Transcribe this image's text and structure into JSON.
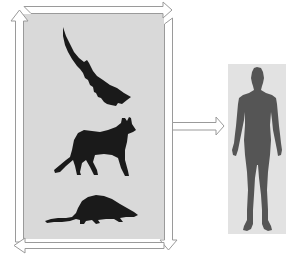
{
  "diagram": {
    "description": "Animal models (bat, fox, shrew) in a cycle leading to human",
    "colors": {
      "animal_panel_bg": "#d9d9d9",
      "human_panel_bg": "#e2e2e2",
      "animal_silhouette": "#1a1a1a",
      "human_silhouette": "#555555",
      "arrow_stroke": "#9a9a9a",
      "arrow_fill": "#ffffff"
    },
    "nodes": [
      {
        "id": "bat",
        "label": "bat-silhouette",
        "icon": "bat-icon"
      },
      {
        "id": "fox",
        "label": "fox-silhouette",
        "icon": "fox-icon"
      },
      {
        "id": "shrew",
        "label": "shrew-silhouette",
        "icon": "shrew-icon"
      },
      {
        "id": "human",
        "label": "human-silhouette",
        "icon": "human-icon"
      }
    ],
    "edges": [
      {
        "from": "left-side",
        "to": "top",
        "style": "outline-arrow-up"
      },
      {
        "from": "top",
        "to": "right-side",
        "style": "outline-arrow-right"
      },
      {
        "from": "right-side",
        "to": "bottom",
        "style": "outline-arrow-down"
      },
      {
        "from": "bottom",
        "to": "left-side",
        "style": "outline-arrow-left"
      },
      {
        "from": "animals",
        "to": "human",
        "style": "outline-arrow-right"
      }
    ]
  }
}
